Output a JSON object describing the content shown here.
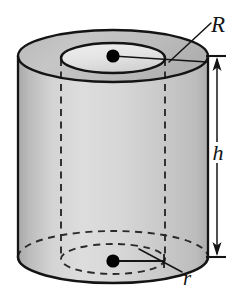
{
  "figure": {
    "shape": "annular cylinder",
    "background_color": "#ffffff",
    "line_color": "#141414",
    "body_fill_color": "#c9c9c9",
    "top_annulus_fill_color": "#b4b4b4",
    "inner_hole_fill_color": "#ededed",
    "dot_color": "#000000"
  },
  "labels": {
    "outer_radius": "R",
    "height": "h",
    "inner_radius": "r"
  },
  "dimensions": {
    "outer_radius_symbol": "R",
    "outer_radius_target": "outer edge of top face",
    "inner_radius_symbol": "r",
    "inner_radius_target": "inner edge of bottom hole",
    "height_symbol": "h",
    "height_span": "from top face to bottom face"
  },
  "annotations": [
    {
      "name": "outer-radius-label",
      "text": "R",
      "x": 218,
      "y": 30,
      "leader": "diagonal leader line from label down-left to outer rim of top face"
    },
    {
      "name": "height-label",
      "text": "h",
      "x": 218,
      "y": 155,
      "leader": "double-headed vertical dimension arrow with end ticks"
    },
    {
      "name": "inner-radius-label",
      "text": "r",
      "x": 187,
      "y": 281,
      "leader": "diagonal leader line from label up-left to inner dashed bottom ellipse"
    }
  ],
  "center_markers": [
    {
      "name": "top-center-dot",
      "x": 113,
      "y": 56,
      "radius": 6.5
    },
    {
      "name": "bottom-center-dot",
      "x": 113,
      "y": 261,
      "radius": 6.5
    }
  ],
  "geometry": {
    "outer_cylinder": {
      "center_x": 113,
      "top_center_y": 56,
      "bottom_center_y": 257,
      "radius_x": 95,
      "radius_y": 26
    },
    "inner_cylinder": {
      "center_x": 113,
      "top_center_y": 58,
      "bottom_center_y": 259,
      "radius_x": 52,
      "radius_y": 15
    }
  }
}
